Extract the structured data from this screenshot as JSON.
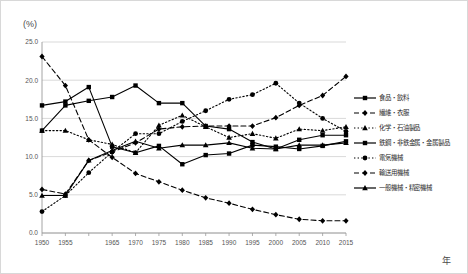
{
  "chart_data": {
    "type": "line",
    "title": "",
    "subtitle": "",
    "xlabel": "年",
    "ylabel": "(%)",
    "ylim": [
      0.0,
      25.0
    ],
    "yticks": [
      "0.0",
      "5.0",
      "10.0",
      "15.0",
      "20.0",
      "25.0"
    ],
    "ytick_values": [
      0.0,
      5.0,
      10.0,
      15.0,
      20.0,
      25.0
    ],
    "grid": true,
    "grid_axis": "y",
    "legend_position": "right",
    "x": [
      1950,
      1955,
      1960,
      1965,
      1970,
      1975,
      1980,
      1985,
      1990,
      1995,
      2000,
      2005,
      2010,
      2015
    ],
    "xtick_labels": [
      "1950",
      "1955",
      "",
      "1965",
      "1970",
      "1975",
      "1980",
      "1985",
      "1990",
      "1995",
      "2000",
      "2005",
      "2010",
      "2015"
    ],
    "series": [
      {
        "name": "食品・飲料",
        "line_style": "solid",
        "marker": "square",
        "color": "#000000",
        "values": [
          16.7,
          17.2,
          19.1,
          11.3,
          10.5,
          11.4,
          9.0,
          10.2,
          10.4,
          11.5,
          11.3,
          11.0,
          11.4,
          12.0
        ]
      },
      {
        "name": "繊維・衣服",
        "line_style": "dashed",
        "marker": "diamond",
        "color": "#000000",
        "values": [
          23.1,
          19.3,
          12.2,
          9.9,
          7.8,
          6.7,
          5.6,
          4.6,
          3.9,
          3.1,
          2.4,
          1.8,
          1.6,
          1.6
        ]
      },
      {
        "name": "化学・石油製品",
        "line_style": "dotted",
        "marker": "triangle",
        "color": "#000000",
        "values": [
          13.4,
          13.4,
          12.2,
          11.6,
          10.5,
          14.1,
          15.4,
          13.9,
          12.5,
          13.0,
          12.4,
          13.6,
          13.4,
          13.9
        ]
      },
      {
        "name": "鉄鋼・非鉄金属・金属製品",
        "line_style": "solid",
        "marker": "square",
        "color": "#000000",
        "values": [
          13.4,
          16.7,
          17.3,
          17.8,
          19.3,
          17.0,
          17.0,
          14.0,
          13.6,
          11.9,
          11.0,
          12.2,
          12.8,
          12.8
        ]
      },
      {
        "name": "電気機械",
        "line_style": "dotted",
        "marker": "circle",
        "color": "#000000",
        "values": [
          2.8,
          4.9,
          7.9,
          10.6,
          13.0,
          13.0,
          14.6,
          16.0,
          17.5,
          18.1,
          19.6,
          17.0,
          15.0,
          13.3
        ]
      },
      {
        "name": "輸送用機械",
        "line_style": "dashed",
        "marker": "diamond",
        "color": "#000000",
        "values": [
          5.7,
          5.1,
          9.5,
          10.6,
          11.8,
          13.6,
          13.9,
          14.0,
          14.0,
          14.0,
          15.1,
          16.7,
          18.0,
          20.5
        ]
      },
      {
        "name": "一般機械・精密機械",
        "line_style": "solid",
        "marker": "triangle",
        "color": "#000000",
        "values": [
          4.9,
          4.9,
          9.5,
          10.8,
          12.0,
          11.1,
          11.5,
          11.5,
          11.8,
          11.1,
          11.0,
          11.5,
          11.5,
          11.8
        ]
      }
    ]
  },
  "axis": {
    "unit_label": "(%)",
    "x_title": "年"
  }
}
